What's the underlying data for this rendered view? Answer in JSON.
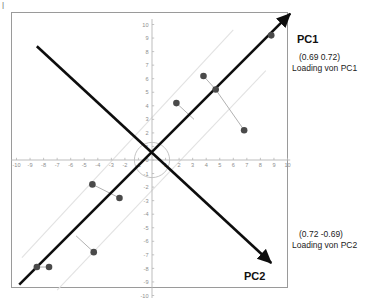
{
  "chart_data": {
    "type": "scatter",
    "title": "",
    "xlabel": "",
    "ylabel": "",
    "xlim": [
      -10,
      10
    ],
    "ylim": [
      -10,
      10
    ],
    "grid": false,
    "xticks": [
      -10,
      -9,
      -8,
      -7,
      -6,
      -5,
      -4,
      -3,
      -2,
      -1,
      0,
      1,
      2,
      3,
      4,
      5,
      6,
      7,
      8,
      9,
      10
    ],
    "yticks": [
      -10,
      -9,
      -8,
      -7,
      -6,
      -5,
      -4,
      -3,
      -2,
      -1,
      0,
      1,
      2,
      3,
      4,
      5,
      6,
      7,
      8,
      9,
      10
    ],
    "xticklabels": [
      "-10",
      "-9",
      "-8",
      "-7",
      "-6",
      "-5",
      "-4",
      "-3",
      "-2",
      "-1",
      "0",
      "1",
      "2",
      "3",
      "4",
      "5",
      "6",
      "7",
      "8",
      "9",
      "10"
    ],
    "yticklabels": [
      "-10",
      "-9",
      "-8",
      "-7",
      "-6",
      "-5",
      "-4",
      "-3",
      "-2",
      "-1",
      "0",
      "1",
      "2",
      "3",
      "4",
      "5",
      "6",
      "7",
      "8",
      "9",
      "10"
    ],
    "series": [
      {
        "name": "data-points",
        "marker": "filled-circle",
        "color": "#4a4a4a",
        "points": [
          {
            "x": -8.5,
            "y": -7.9
          },
          {
            "x": -7.6,
            "y": -7.9
          },
          {
            "x": -4.3,
            "y": -6.8
          },
          {
            "x": -4.4,
            "y": -1.8
          },
          {
            "x": -2.4,
            "y": -2.8
          },
          {
            "x": 1.8,
            "y": 4.2
          },
          {
            "x": 3.8,
            "y": 6.2
          },
          {
            "x": 4.7,
            "y": 5.2
          },
          {
            "x": 6.8,
            "y": 2.2
          },
          {
            "x": 8.8,
            "y": 9.2
          }
        ]
      }
    ],
    "connectors": [
      {
        "from": {
          "x": -8.5,
          "y": -7.9
        },
        "to": {
          "x": -7.6,
          "y": -7.9
        }
      },
      {
        "from": {
          "x": -4.3,
          "y": -6.8
        },
        "to": {
          "x": -5.6,
          "y": -5.6
        }
      },
      {
        "from": {
          "x": -4.4,
          "y": -1.8
        },
        "to": {
          "x": -2.4,
          "y": -2.8
        }
      },
      {
        "from": {
          "x": 1.8,
          "y": 4.2
        },
        "to": {
          "x": 3.1,
          "y": 3.0
        }
      },
      {
        "from": {
          "x": 3.8,
          "y": 6.2
        },
        "to": {
          "x": 4.7,
          "y": 5.2
        }
      },
      {
        "from": {
          "x": 4.7,
          "y": 5.2
        },
        "to": {
          "x": 6.8,
          "y": 2.2
        }
      }
    ],
    "axes_vectors": [
      {
        "name": "PC1",
        "label": "PC1",
        "loading": "(0.69  0.72)",
        "loading_caption": "Loading von PC1",
        "from": {
          "x": -9.8,
          "y": -9.2
        },
        "to": {
          "x": 10.2,
          "y": 10.8
        },
        "color": "#0d0d0d"
      },
      {
        "name": "PC2",
        "label": "PC2",
        "loading": "(0.72  -0.69)",
        "loading_caption": "Loading von PC2",
        "from": {
          "x": -8.5,
          "y": 8.4
        },
        "to": {
          "x": 8.8,
          "y": -7.6
        },
        "color": "#0d0d0d"
      }
    ],
    "band_lines": [
      {
        "from": {
          "x": -9.6,
          "y": -7.2
        },
        "to": {
          "x": 6.0,
          "y": 9.6
        }
      },
      {
        "from": {
          "x": -7.0,
          "y": -9.6
        },
        "to": {
          "x": 8.4,
          "y": 6.6
        }
      }
    ],
    "origin_circle": {
      "cx": 0,
      "cy": 0,
      "r": 1.3,
      "color": "#bdbdbd"
    }
  },
  "labels": {
    "pc1_axis": "PC1",
    "pc2_axis": "PC2",
    "pc1_loading_value": "(0.69  0.72)",
    "pc1_loading_caption": "Loading von PC1",
    "pc2_loading_value": "(0.72  -0.69)",
    "pc2_loading_caption": "Loading von PC2"
  },
  "colors": {
    "point": "#4a4a4a",
    "vector": "#0d0d0d",
    "axis": "#b5b5b5",
    "tick_text": "#8e8e8e",
    "connector": "#a8a8a8",
    "band": "#e2e2e2",
    "frame": "#9a9a9a",
    "background": "#ffffff"
  }
}
